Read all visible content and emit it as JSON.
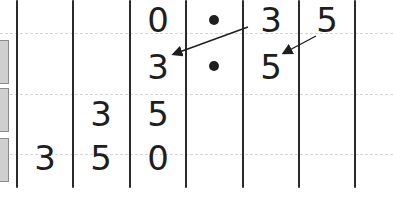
{
  "diagram": {
    "type": "place-value-chart",
    "rows": [
      {
        "cells": [
          "",
          "",
          "",
          "0",
          "•",
          "3",
          "5"
        ]
      },
      {
        "cells": [
          "",
          "",
          "",
          "3",
          "•",
          "5",
          ""
        ]
      },
      {
        "cells": [
          "",
          "",
          "3",
          "5",
          "",
          "",
          ""
        ]
      },
      {
        "cells": [
          "",
          "3",
          "5",
          "0",
          "",
          "",
          ""
        ]
      }
    ],
    "arrows": [
      {
        "from": "row0-col5",
        "to": "row1-col3",
        "label": "3 shifts left"
      },
      {
        "from": "row0-col6",
        "to": "row1-col5",
        "label": "5 shifts left"
      }
    ],
    "colors": {
      "ink": "#1e1e1e",
      "gridline": "#d4d4d4",
      "tab": "#cfcfcf"
    }
  },
  "text": {
    "r0c3": "0",
    "r0c4": "•",
    "r0c5": "3",
    "r0c6": "5",
    "r1c3": "3",
    "r1c5": "5",
    "r2c2": "3",
    "r2c3": "5",
    "r3c1": "3",
    "r3c2": "5",
    "r3c3": "0"
  }
}
